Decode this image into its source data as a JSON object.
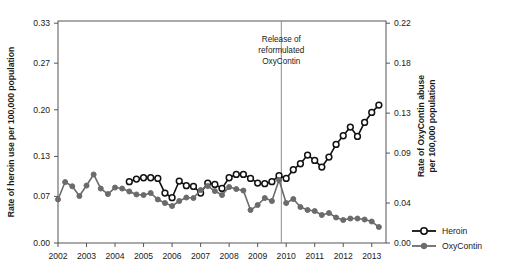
{
  "chart_data": {
    "type": "line",
    "title": "",
    "xlabel": "",
    "ylabel": "Rate of heroin use per 100,000 population",
    "y2label_line1": "Rate of OxyContin abuse",
    "y2label_line2": "per 100,000 population",
    "xlim": [
      2002.0,
      2013.5
    ],
    "ylim": [
      0.0,
      0.3333
    ],
    "y2lim": [
      0.0,
      0.2222
    ],
    "xticks": [
      2002,
      2003,
      2004,
      2005,
      2006,
      2007,
      2008,
      2009,
      2010,
      2011,
      2012,
      2013
    ],
    "xticklabels": [
      "2002",
      "2003",
      "2004",
      "2005",
      "2006",
      "2007",
      "2008",
      "2009",
      "2010",
      "2011",
      "2012",
      "2013"
    ],
    "yticks": [
      0.0,
      0.07,
      0.13,
      0.2,
      0.27,
      0.33
    ],
    "yticklabels": [
      "0.00",
      "0.07",
      "0.13",
      "0.20",
      "0.27",
      "0.33"
    ],
    "y2ticks": [
      0.0,
      0.04,
      0.09,
      0.13,
      0.18,
      0.22
    ],
    "y2ticklabels": [
      "0.00",
      "0.04",
      "0.09",
      "0.13",
      "0.18",
      "0.22"
    ],
    "grid": false,
    "legend_position": "right-bottom-outside",
    "annotations": [
      {
        "name": "reformulation-marker",
        "text_lines": [
          "Release of",
          "reformulated",
          "OxyContin"
        ],
        "x": 2009.83,
        "line_color": "#8c8c8c"
      }
    ],
    "series": [
      {
        "name": "Heroin",
        "axis": "left",
        "color": "#111111",
        "marker": "open-circle",
        "x": [
          2004.5,
          2004.75,
          2005.0,
          2005.25,
          2005.5,
          2005.75,
          2006.0,
          2006.25,
          2006.5,
          2006.75,
          2007.0,
          2007.25,
          2007.5,
          2007.75,
          2008.0,
          2008.25,
          2008.5,
          2008.75,
          2009.0,
          2009.25,
          2009.5,
          2009.75,
          2010.0,
          2010.25,
          2010.5,
          2010.75,
          2011.0,
          2011.25,
          2011.5,
          2011.75,
          2012.0,
          2012.25,
          2012.5,
          2012.75,
          2013.0,
          2013.25
        ],
        "y": [
          0.092,
          0.096,
          0.098,
          0.098,
          0.097,
          0.075,
          0.068,
          0.093,
          0.086,
          0.085,
          0.075,
          0.09,
          0.088,
          0.082,
          0.098,
          0.103,
          0.103,
          0.097,
          0.09,
          0.089,
          0.092,
          0.101,
          0.097,
          0.11,
          0.119,
          0.132,
          0.124,
          0.114,
          0.129,
          0.148,
          0.161,
          0.174,
          0.16,
          0.181,
          0.196,
          0.207
        ]
      },
      {
        "name": "OxyContin",
        "axis": "right",
        "color": "#6b6b6b",
        "marker": "filled-circle",
        "x": [
          2002.0,
          2002.25,
          2002.5,
          2002.75,
          2003.0,
          2003.25,
          2003.5,
          2003.75,
          2004.0,
          2004.25,
          2004.5,
          2004.75,
          2005.0,
          2005.25,
          2005.5,
          2005.75,
          2006.0,
          2006.25,
          2006.5,
          2006.75,
          2007.0,
          2007.25,
          2007.5,
          2007.75,
          2008.0,
          2008.25,
          2008.5,
          2008.75,
          2009.0,
          2009.25,
          2009.5,
          2009.75,
          2010.0,
          2010.25,
          2010.5,
          2010.75,
          2011.0,
          2011.25,
          2011.5,
          2011.75,
          2012.0,
          2012.25,
          2012.5,
          2012.75,
          2013.0,
          2013.25
        ],
        "y": [
          0.0436,
          0.061,
          0.0568,
          0.047,
          0.0575,
          0.0686,
          0.0545,
          0.049,
          0.0555,
          0.0545,
          0.0516,
          0.0486,
          0.048,
          0.05,
          0.0436,
          0.04,
          0.037,
          0.042,
          0.0455,
          0.045,
          0.053,
          0.057,
          0.052,
          0.048,
          0.056,
          0.054,
          0.0525,
          0.033,
          0.038,
          0.045,
          0.042,
          0.063,
          0.04,
          0.044,
          0.036,
          0.033,
          0.032,
          0.028,
          0.03,
          0.0255,
          0.023,
          0.0245,
          0.0245,
          0.0235,
          0.0215,
          0.016
        ]
      }
    ]
  },
  "legend": {
    "items": [
      {
        "label": "Heroin",
        "color": "#111111",
        "marker": "open-circle"
      },
      {
        "label": "OxyContin",
        "color": "#6b6b6b",
        "marker": "filled-circle"
      }
    ]
  }
}
